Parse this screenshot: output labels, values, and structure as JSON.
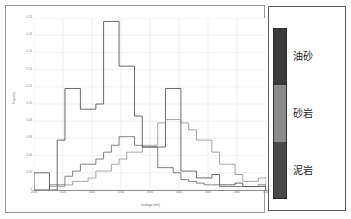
{
  "figure": {
    "background_color": "#ffffff",
    "frame_color": "#9a9a9a"
  },
  "chart_data": {
    "type": "line",
    "variant": "step-histogram",
    "title": "",
    "xlabel": "Leakage (m/s)",
    "ylabel": "Frequency",
    "grid": true,
    "grid_color": "#e8e8e8",
    "legend_position": "right-outside",
    "xlim": [
      2800,
      5200
    ],
    "ylim": [
      0.0,
      0.2
    ],
    "yticks": [
      "0.20",
      "0.18",
      "0.16",
      "0.14",
      "0.12",
      "0.10",
      "0.08",
      "0.06",
      "0.04",
      "0.02",
      "0"
    ],
    "ytick_values": [
      0.2,
      0.18,
      0.16,
      0.14,
      0.12,
      0.1,
      0.08,
      0.06,
      0.04,
      0.02,
      0.0
    ],
    "xticks": [
      "2800",
      "3100",
      "3400",
      "3700",
      "4000",
      "4300",
      "4600",
      "4900",
      "5200"
    ],
    "xtick_values": [
      2800,
      3100,
      3400,
      3700,
      4000,
      4300,
      4600,
      4900,
      5200
    ],
    "x_bin_edges": [
      2800,
      2880,
      2960,
      3040,
      3120,
      3200,
      3280,
      3360,
      3440,
      3520,
      3600,
      3680,
      3760,
      3840,
      3920,
      4000,
      4080,
      4160,
      4240,
      4320,
      4400,
      4480,
      4560,
      4640,
      4720,
      4800,
      4880,
      4960,
      5040,
      5120,
      5200
    ],
    "series": [
      {
        "name": "油砂",
        "color": "#3a3a3a",
        "values": [
          0.02,
          0.02,
          0.0,
          0.058,
          0.118,
          0.118,
          0.094,
          0.094,
          0.1,
          0.196,
          0.196,
          0.144,
          0.144,
          0.086,
          0.05,
          0.05,
          0.05,
          0.118,
          0.118,
          0.022,
          0.022,
          0.014,
          0.014,
          0.018,
          0.006,
          0.006,
          0.008,
          0.004,
          0.004,
          0.004
        ]
      },
      {
        "name": "砂岩",
        "color": "#8a8a8a",
        "values": [
          0.0,
          0.0,
          0.004,
          0.004,
          0.006,
          0.01,
          0.01,
          0.014,
          0.022,
          0.022,
          0.03,
          0.036,
          0.044,
          0.044,
          0.052,
          0.052,
          0.078,
          0.082,
          0.082,
          0.078,
          0.07,
          0.058,
          0.058,
          0.044,
          0.03,
          0.03,
          0.018,
          0.01,
          0.01,
          0.014
        ]
      },
      {
        "name": "泥岩",
        "color": "#5a5a5a",
        "values": [
          0.0,
          0.0,
          0.006,
          0.006,
          0.016,
          0.022,
          0.03,
          0.03,
          0.036,
          0.044,
          0.052,
          0.062,
          0.062,
          0.052,
          0.05,
          0.05,
          0.026,
          0.026,
          0.02,
          0.012,
          0.01,
          0.008,
          0.006,
          0.006,
          0.004,
          0.004,
          0.004,
          0.004,
          0.004,
          0.006
        ]
      }
    ]
  },
  "legend": {
    "items": [
      {
        "label": "油砂",
        "color": "#3a3a3a"
      },
      {
        "label": "砂岩",
        "color": "#8a8a8a"
      },
      {
        "label": "泥岩",
        "color": "#4a4a4a"
      }
    ]
  }
}
